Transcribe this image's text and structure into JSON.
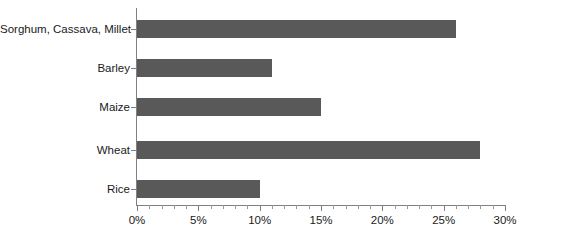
{
  "chart_data": {
    "type": "bar",
    "orientation": "horizontal",
    "title": "",
    "subtitle": "",
    "xlabel": "",
    "ylabel": "",
    "categories": [
      "Sorghum, Cassava, Millet",
      "Barley",
      "Maize",
      "Wheat",
      "Rice"
    ],
    "values": [
      26,
      11,
      15,
      28,
      10
    ],
    "value_suffix": "%",
    "xlim": [
      0,
      30
    ],
    "x_major_ticks": [
      0,
      5,
      10,
      15,
      20,
      25,
      30
    ],
    "x_tick_labels": [
      "0%",
      "5%",
      "10%",
      "15%",
      "20%",
      "25%",
      "30%"
    ],
    "x_minor_tick_step": 1,
    "grid": false,
    "legend": false,
    "legend_position": "none",
    "series": [
      {
        "name": "",
        "values": [
          26,
          11,
          15,
          28,
          10
        ]
      }
    ],
    "colors": {
      "bar_fill": "#595959",
      "axis_line": "#808080",
      "text": "#1a1a1a",
      "background": "#ffffff"
    }
  },
  "axis": {
    "x_labels": [
      "0%",
      "5%",
      "10%",
      "15%",
      "20%",
      "25%",
      "30%"
    ],
    "y_labels": [
      "Sorghum, Cassava, Millet",
      "Barley",
      "Maize",
      "Wheat",
      "Rice"
    ]
  }
}
